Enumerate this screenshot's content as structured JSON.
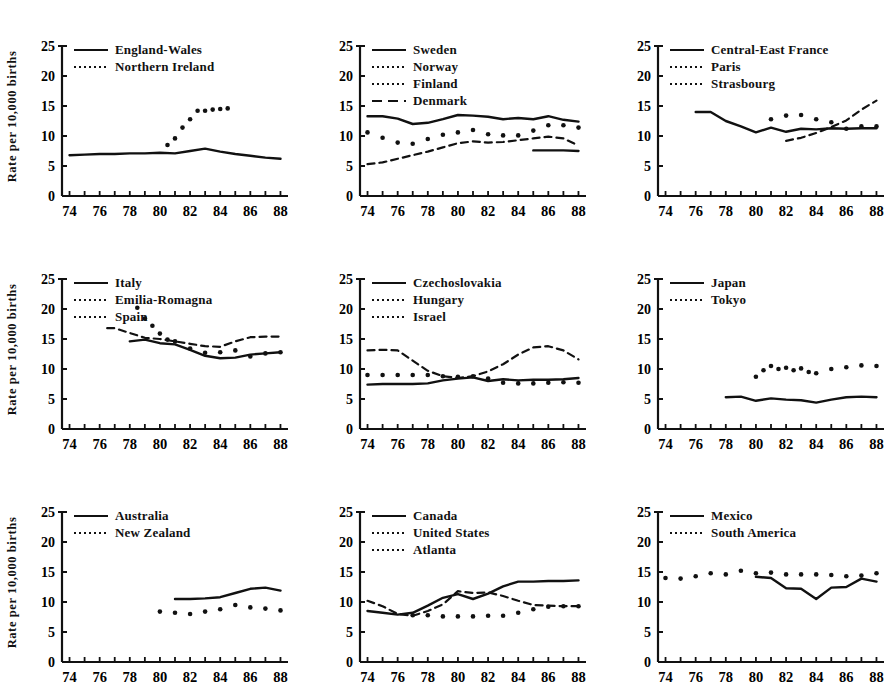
{
  "figure": {
    "ylabel": "Rate per 10,000 births",
    "y_ticks": [
      "0",
      "5",
      "10",
      "15",
      "20",
      "25"
    ],
    "x_ticks": [
      "74",
      "76",
      "78",
      "80",
      "82",
      "84",
      "86",
      "88"
    ],
    "line_color": "#111111"
  },
  "chart_data": [
    {
      "type": "line",
      "panel": 1,
      "title": "",
      "xlabel": "",
      "ylabel": "Rate per 10,000 births",
      "xlim": [
        73.5,
        88.5
      ],
      "ylim": [
        0,
        25
      ],
      "grid": false,
      "legend_position": "top-left",
      "series": [
        {
          "name": "England-Wales",
          "style": "solid",
          "x": [
            74,
            75,
            76,
            77,
            78,
            79,
            80,
            81,
            82,
            83,
            84,
            85,
            86,
            87,
            88
          ],
          "values": [
            6.8,
            6.9,
            7.0,
            7.0,
            7.1,
            7.1,
            7.2,
            7.1,
            7.5,
            7.9,
            7.4,
            7.0,
            6.7,
            6.4,
            6.2
          ]
        },
        {
          "name": "Northern Ireland",
          "style": "dotted",
          "x": [
            80.5,
            81,
            81.5,
            82,
            82.5,
            83,
            83.5,
            84,
            84.5
          ],
          "values": [
            8.5,
            9.6,
            11.4,
            12.8,
            14.2,
            14.2,
            14.4,
            14.5,
            14.6
          ]
        }
      ]
    },
    {
      "type": "line",
      "panel": 2,
      "title": "",
      "xlabel": "",
      "ylabel": "",
      "xlim": [
        73.5,
        88.5
      ],
      "ylim": [
        0,
        25
      ],
      "grid": false,
      "legend_position": "top-left",
      "series": [
        {
          "name": "Sweden",
          "style": "solid",
          "x": [
            74,
            75,
            76,
            77,
            78,
            79,
            80,
            81,
            82,
            83,
            84,
            85,
            86,
            87,
            88
          ],
          "values": [
            13.3,
            13.3,
            12.9,
            12.0,
            12.2,
            12.8,
            13.5,
            13.4,
            13.2,
            12.8,
            13.0,
            12.8,
            13.3,
            12.7,
            12.4
          ]
        },
        {
          "name": "Norway",
          "style": "dotted",
          "x": [
            74,
            75,
            76,
            77,
            78,
            79,
            80,
            81,
            82,
            83,
            84,
            85,
            86,
            87,
            88
          ],
          "values": [
            10.6,
            9.7,
            8.9,
            8.7,
            9.5,
            10.2,
            10.6,
            11.0,
            10.3,
            10.1,
            10.1,
            10.9,
            11.8,
            11.8,
            11.4
          ]
        },
        {
          "name": "Finland",
          "style": "solid-short",
          "x": [
            85,
            86,
            87,
            88
          ],
          "values": [
            7.6,
            7.6,
            7.6,
            7.5
          ]
        },
        {
          "name": "Denmark",
          "style": "dashed",
          "x": [
            74,
            75,
            76,
            77,
            78,
            79,
            80,
            81,
            82,
            83,
            84,
            85,
            86,
            87,
            88
          ],
          "values": [
            5.3,
            5.6,
            6.2,
            6.8,
            7.4,
            8.1,
            8.8,
            9.1,
            8.9,
            9.0,
            9.3,
            9.6,
            9.9,
            9.6,
            8.4
          ]
        }
      ]
    },
    {
      "type": "line",
      "panel": 3,
      "title": "",
      "xlabel": "",
      "ylabel": "",
      "xlim": [
        73.5,
        88.5
      ],
      "ylim": [
        0,
        25
      ],
      "grid": false,
      "legend_position": "top-left",
      "series": [
        {
          "name": "Central-East France",
          "style": "solid",
          "x": [
            76,
            77,
            78,
            79,
            80,
            81,
            82,
            83,
            84,
            85,
            86,
            87,
            88
          ],
          "values": [
            14.0,
            14.0,
            12.5,
            11.6,
            10.6,
            11.4,
            10.7,
            11.2,
            11.1,
            11.3,
            11.2,
            11.3,
            11.3
          ]
        },
        {
          "name": "Paris",
          "style": "dotted",
          "x": [
            81,
            82,
            83,
            84,
            85,
            86,
            87,
            88
          ],
          "values": [
            12.8,
            13.4,
            13.5,
            12.8,
            12.3,
            11.2,
            11.6,
            11.6
          ]
        },
        {
          "name": "Strasbourg",
          "style": "dashed",
          "x": [
            82,
            83,
            84,
            85,
            86,
            87,
            88
          ],
          "values": [
            9.2,
            9.7,
            10.5,
            11.5,
            12.6,
            14.4,
            15.9
          ]
        }
      ]
    },
    {
      "type": "line",
      "panel": 4,
      "title": "",
      "xlabel": "",
      "ylabel": "Rate per 10,000 births",
      "xlim": [
        73.5,
        88.5
      ],
      "ylim": [
        0,
        25
      ],
      "grid": false,
      "legend_position": "top-left",
      "series": [
        {
          "name": "Italy",
          "style": "solid",
          "x": [
            78,
            79,
            80,
            81,
            82,
            83,
            84,
            85,
            86,
            87,
            88
          ],
          "values": [
            14.6,
            14.9,
            14.3,
            14.1,
            13.2,
            12.2,
            11.8,
            11.9,
            12.4,
            12.6,
            12.8
          ]
        },
        {
          "name": "Emilia-Romagna",
          "style": "dashed",
          "x": [
            76.5,
            77,
            78,
            79,
            80,
            81,
            82,
            83,
            84,
            85,
            86,
            87,
            88
          ],
          "values": [
            16.8,
            16.8,
            16.0,
            15.2,
            15.0,
            14.6,
            14.2,
            13.8,
            13.7,
            14.6,
            15.3,
            15.4,
            15.4
          ]
        },
        {
          "name": "Spain",
          "style": "dotted",
          "x": [
            78.5,
            79,
            79.5,
            80,
            80.5,
            81,
            82,
            83,
            84,
            85,
            86,
            87,
            88
          ],
          "values": [
            20.2,
            18.4,
            17.2,
            15.9,
            14.9,
            14.6,
            13.4,
            12.7,
            12.8,
            13.1,
            12.1,
            12.6,
            12.8
          ]
        }
      ]
    },
    {
      "type": "line",
      "panel": 5,
      "title": "",
      "xlabel": "",
      "ylabel": "",
      "xlim": [
        73.5,
        88.5
      ],
      "ylim": [
        0,
        25
      ],
      "grid": false,
      "legend_position": "top-left",
      "series": [
        {
          "name": "Czechoslovakia",
          "style": "solid",
          "x": [
            74,
            75,
            76,
            77,
            78,
            79,
            80,
            81,
            82,
            83,
            84,
            85,
            86,
            87,
            88
          ],
          "values": [
            7.4,
            7.5,
            7.5,
            7.5,
            7.6,
            8.1,
            8.4,
            8.6,
            8.0,
            8.3,
            8.1,
            8.2,
            8.2,
            8.3,
            8.5
          ]
        },
        {
          "name": "Hungary",
          "style": "dotted",
          "x": [
            74,
            75,
            76,
            77,
            78,
            79,
            80,
            81,
            82,
            83,
            84,
            85,
            86,
            87,
            88
          ],
          "values": [
            9.0,
            9.0,
            9.0,
            9.0,
            9.0,
            8.8,
            8.7,
            8.8,
            8.4,
            7.7,
            7.6,
            7.6,
            7.7,
            7.8,
            7.7
          ]
        },
        {
          "name": "Israel",
          "style": "dashed",
          "x": [
            74,
            75,
            76,
            77,
            78,
            79,
            80,
            81,
            82,
            83,
            84,
            85,
            86,
            87,
            88
          ],
          "values": [
            13.1,
            13.2,
            13.1,
            11.4,
            9.7,
            8.8,
            8.5,
            8.8,
            9.6,
            10.8,
            12.4,
            13.6,
            13.8,
            13.1,
            11.6
          ]
        }
      ]
    },
    {
      "type": "line",
      "panel": 6,
      "title": "",
      "xlabel": "",
      "ylabel": "",
      "xlim": [
        73.5,
        88.5
      ],
      "ylim": [
        0,
        25
      ],
      "grid": false,
      "legend_position": "top-left",
      "series": [
        {
          "name": "Japan",
          "style": "solid",
          "x": [
            78,
            79,
            80,
            81,
            82,
            83,
            84,
            85,
            86,
            87,
            88
          ],
          "values": [
            5.3,
            5.4,
            4.7,
            5.1,
            4.9,
            4.8,
            4.4,
            4.9,
            5.3,
            5.4,
            5.3
          ]
        },
        {
          "name": "Tokyo",
          "style": "dotted",
          "x": [
            80,
            80.5,
            81,
            81.5,
            82,
            82.5,
            83,
            83.5,
            84,
            85,
            86,
            87,
            88
          ],
          "values": [
            8.7,
            9.8,
            10.5,
            10.0,
            10.2,
            9.8,
            10.1,
            9.5,
            9.3,
            10.0,
            10.3,
            10.6,
            10.5
          ]
        }
      ]
    },
    {
      "type": "line",
      "panel": 7,
      "title": "",
      "xlabel": "",
      "ylabel": "Rate per 10,000 births",
      "xlim": [
        73.5,
        88.5
      ],
      "ylim": [
        0,
        25
      ],
      "grid": false,
      "legend_position": "top-left",
      "series": [
        {
          "name": "Australia",
          "style": "solid",
          "x": [
            81,
            82,
            83,
            84,
            85,
            86,
            87,
            88
          ],
          "values": [
            10.5,
            10.5,
            10.6,
            10.8,
            11.5,
            12.2,
            12.4,
            11.9
          ]
        },
        {
          "name": "New Zealand",
          "style": "dotted",
          "x": [
            80,
            81,
            82,
            83,
            84,
            85,
            86,
            87,
            88
          ],
          "values": [
            8.4,
            8.2,
            8.0,
            8.4,
            8.8,
            9.5,
            9.1,
            8.9,
            8.6
          ]
        }
      ]
    },
    {
      "type": "line",
      "panel": 8,
      "title": "",
      "xlabel": "",
      "ylabel": "",
      "xlim": [
        73.5,
        88.5
      ],
      "ylim": [
        0,
        25
      ],
      "grid": false,
      "legend_position": "top-left",
      "series": [
        {
          "name": "Canada",
          "style": "solid",
          "x": [
            74,
            75,
            76,
            77,
            78,
            79,
            80,
            81,
            82,
            83,
            84,
            85,
            86,
            87,
            88
          ],
          "values": [
            8.5,
            8.2,
            7.9,
            8.2,
            9.4,
            10.7,
            11.3,
            10.5,
            11.4,
            12.6,
            13.4,
            13.4,
            13.5,
            13.5,
            13.6
          ]
        },
        {
          "name": "United States",
          "style": "dotted",
          "x": [
            77,
            78,
            79,
            80,
            81,
            82,
            83,
            84,
            85,
            86,
            87,
            88
          ],
          "values": [
            7.8,
            7.8,
            7.6,
            7.6,
            7.6,
            7.7,
            7.7,
            8.2,
            8.8,
            9.2,
            9.3,
            9.3
          ]
        },
        {
          "name": "Atlanta",
          "style": "dashed",
          "x": [
            74,
            75,
            76,
            77,
            78,
            79,
            80,
            81,
            82,
            83,
            84,
            85,
            86,
            87,
            88
          ],
          "values": [
            10.2,
            9.3,
            8.0,
            7.7,
            8.5,
            9.6,
            11.8,
            11.5,
            11.6,
            11.0,
            10.2,
            9.5,
            9.4,
            9.3,
            9.3
          ]
        }
      ]
    },
    {
      "type": "line",
      "panel": 9,
      "title": "",
      "xlabel": "",
      "ylabel": "",
      "xlim": [
        73.5,
        88.5
      ],
      "ylim": [
        0,
        25
      ],
      "grid": false,
      "legend_position": "top-left",
      "series": [
        {
          "name": "Mexico",
          "style": "solid",
          "x": [
            80,
            81,
            82,
            83,
            84,
            85,
            86,
            87,
            88
          ],
          "values": [
            14.2,
            14.0,
            12.3,
            12.2,
            10.5,
            12.4,
            12.5,
            13.9,
            13.4
          ]
        },
        {
          "name": "South America",
          "style": "dotted",
          "x": [
            74,
            75,
            76,
            77,
            78,
            79,
            80,
            81,
            82,
            83,
            84,
            85,
            86,
            87,
            88
          ],
          "values": [
            14.0,
            13.9,
            14.3,
            14.8,
            14.6,
            15.2,
            14.8,
            14.9,
            14.6,
            14.6,
            14.6,
            14.5,
            14.3,
            14.4,
            14.8
          ]
        }
      ]
    }
  ],
  "panels": [
    {
      "id": "england-wales",
      "legend": [
        {
          "label": "England-Wales",
          "style": "solid"
        },
        {
          "label": "Northern Ireland",
          "style": "dotted"
        }
      ]
    },
    {
      "id": "sweden",
      "legend": [
        {
          "label": "Sweden",
          "style": "solid"
        },
        {
          "label": "Norway",
          "style": "dotted"
        },
        {
          "label": "Finland",
          "style": "dotted"
        },
        {
          "label": "Denmark",
          "style": "dashed"
        }
      ]
    },
    {
      "id": "central-east-france",
      "legend": [
        {
          "label": "Central-East France",
          "style": "solid"
        },
        {
          "label": "Paris",
          "style": "dotted"
        },
        {
          "label": "Strasbourg",
          "style": "dotted"
        }
      ]
    },
    {
      "id": "italy",
      "legend": [
        {
          "label": "Italy",
          "style": "solid"
        },
        {
          "label": "Emilia-Romagna",
          "style": "dotted"
        },
        {
          "label": "Spain",
          "style": "dotted"
        }
      ]
    },
    {
      "id": "czechoslovakia",
      "legend": [
        {
          "label": "Czechoslovakia",
          "style": "solid"
        },
        {
          "label": "Hungary",
          "style": "dotted"
        },
        {
          "label": "Israel",
          "style": "dotted"
        }
      ]
    },
    {
      "id": "japan",
      "legend": [
        {
          "label": "Japan",
          "style": "solid"
        },
        {
          "label": "Tokyo",
          "style": "dotted"
        }
      ]
    },
    {
      "id": "australia",
      "legend": [
        {
          "label": "Australia",
          "style": "solid"
        },
        {
          "label": "New Zealand",
          "style": "dotted"
        }
      ]
    },
    {
      "id": "canada",
      "legend": [
        {
          "label": "Canada",
          "style": "solid"
        },
        {
          "label": "United States",
          "style": "dotted"
        },
        {
          "label": "Atlanta",
          "style": "dotted"
        }
      ]
    },
    {
      "id": "mexico",
      "legend": [
        {
          "label": "Mexico",
          "style": "solid"
        },
        {
          "label": "South America",
          "style": "dotted"
        }
      ]
    }
  ]
}
